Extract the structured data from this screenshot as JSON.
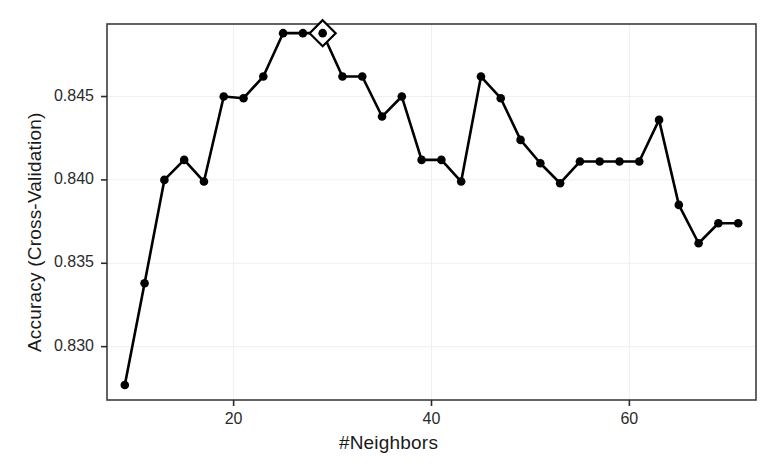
{
  "chart_data": {
    "type": "line",
    "title": "",
    "subtitle": "",
    "xlabel": "#Neighbors",
    "ylabel": "Accuracy (Cross-Validation)",
    "xlim": [
      7.2,
      72.8
    ],
    "ylim": [
      0.8268,
      0.84935
    ],
    "grid": true,
    "legend": false,
    "legend_position": "none",
    "marker": "filled-circle",
    "line_color": "#000000",
    "marker_color": "#000000",
    "panel_border_color": "#3c3c3c",
    "grid_color": "#efefef",
    "background": "#ffffff",
    "xticks": [
      20,
      40,
      60
    ],
    "xtick_labels": [
      "20",
      "40",
      "60"
    ],
    "yticks": [
      0.83,
      0.835,
      0.84,
      0.845
    ],
    "ytick_labels": [
      "0.830",
      "0.835",
      "0.840",
      "0.845"
    ],
    "highlight": {
      "marker": "open-diamond",
      "x": 29,
      "y": 0.8488,
      "label": ""
    },
    "x": [
      9,
      11,
      13,
      15,
      17,
      19,
      21,
      23,
      25,
      27,
      29,
      31,
      33,
      35,
      37,
      39,
      41,
      43,
      45,
      47,
      49,
      51,
      53,
      55,
      57,
      59,
      61,
      63,
      65,
      67,
      69,
      71
    ],
    "values": [
      0.8277,
      0.8338,
      0.84,
      0.8412,
      0.8399,
      0.845,
      0.8449,
      0.8462,
      0.8488,
      0.8488,
      0.8488,
      0.8462,
      0.8462,
      0.8438,
      0.845,
      0.8412,
      0.8412,
      0.8399,
      0.8462,
      0.8449,
      0.8424,
      0.841,
      0.8398,
      0.8411,
      0.8411,
      0.8411,
      0.8411,
      0.8436,
      0.8385,
      0.8362,
      0.8374,
      0.8374
    ],
    "series": [
      {
        "name": "Cross-Validation Accuracy",
        "values": [
          0.8277,
          0.8338,
          0.84,
          0.8412,
          0.8399,
          0.845,
          0.8449,
          0.8462,
          0.8488,
          0.8488,
          0.8488,
          0.8462,
          0.8462,
          0.8438,
          0.845,
          0.8412,
          0.8412,
          0.8399,
          0.8462,
          0.8449,
          0.8424,
          0.841,
          0.8398,
          0.8411,
          0.8411,
          0.8411,
          0.8411,
          0.8436,
          0.8385,
          0.8362,
          0.8374,
          0.8374
        ]
      }
    ]
  }
}
